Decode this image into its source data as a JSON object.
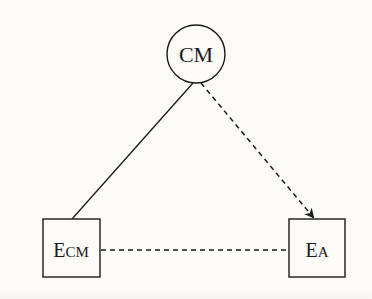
{
  "diagram": {
    "nodes": [
      {
        "id": "CM",
        "shape": "circle",
        "label": "CM",
        "cx": 196,
        "cy": 54,
        "r": 29
      },
      {
        "id": "ECM",
        "shape": "square",
        "label_main": "E",
        "label_sub": "CM",
        "x": 43,
        "y": 219,
        "w": 57,
        "h": 58
      },
      {
        "id": "EA",
        "shape": "square",
        "label_main": "E",
        "label_sub": "A",
        "x": 289,
        "y": 219,
        "w": 56,
        "h": 58
      }
    ],
    "edges": [
      {
        "from": "CM",
        "to": "ECM",
        "style": "solid",
        "arrow": false
      },
      {
        "from": "CM",
        "to": "EA",
        "style": "dashed",
        "arrow": true
      },
      {
        "from": "ECM",
        "to": "EA",
        "style": "dashed",
        "arrow": false
      }
    ],
    "colors": {
      "background": "#fcfbf7",
      "stroke": "#1a1a1a"
    }
  }
}
